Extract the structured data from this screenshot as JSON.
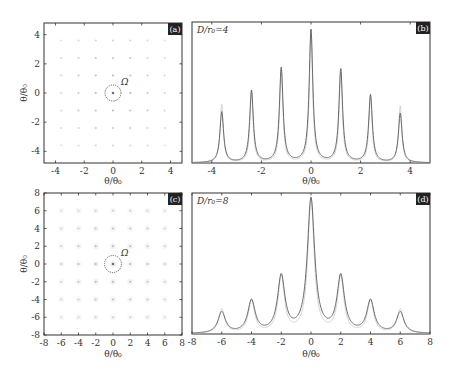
{
  "figure": {
    "panels": [
      "a",
      "b",
      "c",
      "d"
    ]
  },
  "chart_data": [
    {
      "id": "a",
      "type": "scatter",
      "badge": "(a)",
      "title": "",
      "xlabel": "θ/θ₀",
      "ylabel": "θ/θ₀",
      "xlim": [
        -4.8,
        4.8
      ],
      "ylim": [
        -4.8,
        4.8
      ],
      "xticks": [
        -4,
        -2,
        0,
        2,
        4
      ],
      "yticks": [
        -4,
        -2,
        0,
        2,
        4
      ],
      "grid": false,
      "points_grid": [
        -3.6,
        -2.4,
        -1.2,
        0,
        1.2,
        2.4,
        3.6
      ],
      "description": "7x7 lattice of diffraction spots, brightest at center",
      "annotation": {
        "label": "Ω",
        "circle_center": [
          0,
          0
        ],
        "circle_radius": 0.55
      }
    },
    {
      "id": "b",
      "type": "line",
      "badge": "(b)",
      "annotation_text": "D/r₀=4",
      "xlabel": "θ/θ₀",
      "ylabel": "",
      "xlim": [
        -4.8,
        4.8
      ],
      "ylim": [
        0,
        1
      ],
      "xticks": [
        -4,
        -2,
        0,
        2,
        4
      ],
      "grid": false,
      "peaks": [
        {
          "x": -3.6,
          "y": 0.36
        },
        {
          "x": -2.4,
          "y": 0.51
        },
        {
          "x": -1.2,
          "y": 0.67
        },
        {
          "x": 0,
          "y": 0.94
        },
        {
          "x": 1.2,
          "y": 0.66
        },
        {
          "x": 2.4,
          "y": 0.48
        },
        {
          "x": 3.6,
          "y": 0.35
        }
      ],
      "peak_width": 0.09,
      "series": [
        {
          "name": "profile",
          "color": "#666666"
        },
        {
          "name": "reference",
          "color": "#bbbbbb"
        }
      ]
    },
    {
      "id": "c",
      "type": "scatter",
      "badge": "(c)",
      "xlabel": "θ/θ₀",
      "ylabel": "θ/θ₀",
      "xlim": [
        -8,
        8
      ],
      "ylim": [
        -8,
        8
      ],
      "xticks": [
        -8,
        -6,
        -4,
        -2,
        0,
        2,
        4,
        6,
        8
      ],
      "yticks": [
        -8,
        -6,
        -4,
        -2,
        0,
        2,
        4,
        6,
        8
      ],
      "grid": false,
      "points_grid": [
        -6,
        -4,
        -2,
        0,
        2,
        4,
        6
      ],
      "description": "7x7 lattice of diffuse spots, brightest at center",
      "annotation": {
        "label": "Ω",
        "circle_center": [
          0,
          0
        ],
        "circle_radius": 0.95
      }
    },
    {
      "id": "d",
      "type": "line",
      "badge": "(d)",
      "annotation_text": "D/r₀=8",
      "xlabel": "θ/θ₀",
      "ylabel": "",
      "xlim": [
        -8,
        8
      ],
      "ylim": [
        0,
        1
      ],
      "xticks": [
        -8,
        -6,
        -4,
        -2,
        0,
        2,
        4,
        6,
        8
      ],
      "grid": false,
      "peaks": [
        {
          "x": -6,
          "y": 0.15
        },
        {
          "x": -4,
          "y": 0.23
        },
        {
          "x": -2,
          "y": 0.4
        },
        {
          "x": 0,
          "y": 0.95
        },
        {
          "x": 2,
          "y": 0.4
        },
        {
          "x": 4,
          "y": 0.23
        },
        {
          "x": 6,
          "y": 0.15
        }
      ],
      "peak_width": 0.3,
      "series": [
        {
          "name": "profile",
          "color": "#666666"
        },
        {
          "name": "reference",
          "color": "#bbbbbb"
        }
      ]
    }
  ]
}
